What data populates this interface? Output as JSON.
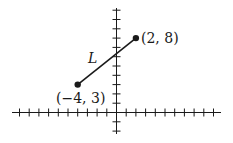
{
  "diagram": {
    "type": "coordinate-plane-line-segment",
    "x_range": [
      -10,
      10
    ],
    "y_range": [
      -2,
      11
    ],
    "line": {
      "label": "L",
      "start": {
        "x": -4,
        "y": 3,
        "label": "(−4, 3)"
      },
      "end": {
        "x": 2,
        "y": 8,
        "label": "(2, 8)"
      }
    },
    "color": "#1a1a1a"
  }
}
